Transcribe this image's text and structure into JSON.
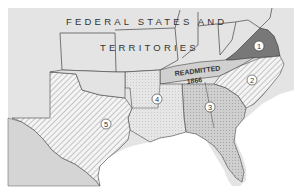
{
  "map": {
    "title_line1": "FEDERAL STATES AND",
    "title_line2": "TERRITORIES",
    "readmitted_label_line1": "READMITTED",
    "readmitted_label_line2": "1866",
    "districts": [
      {
        "number": "1",
        "label": "1",
        "pattern": "dark-solid"
      },
      {
        "number": "2",
        "label": "2",
        "pattern": "diagonal-hatch"
      },
      {
        "number": "3",
        "label": "3",
        "pattern": "fine-stipple"
      },
      {
        "number": "4",
        "label": "4",
        "pattern": "dotted-light"
      },
      {
        "number": "5",
        "label": "5",
        "pattern": "diagonal-hatch"
      }
    ],
    "colors": {
      "federal": "#e3e3e3",
      "readmitted": "#d2d2d2",
      "district1": "#7a7a7a",
      "district3": "#c9c9c9",
      "mexico": "#d6d6d6",
      "water": "#ffffff",
      "border": "#444444"
    }
  }
}
